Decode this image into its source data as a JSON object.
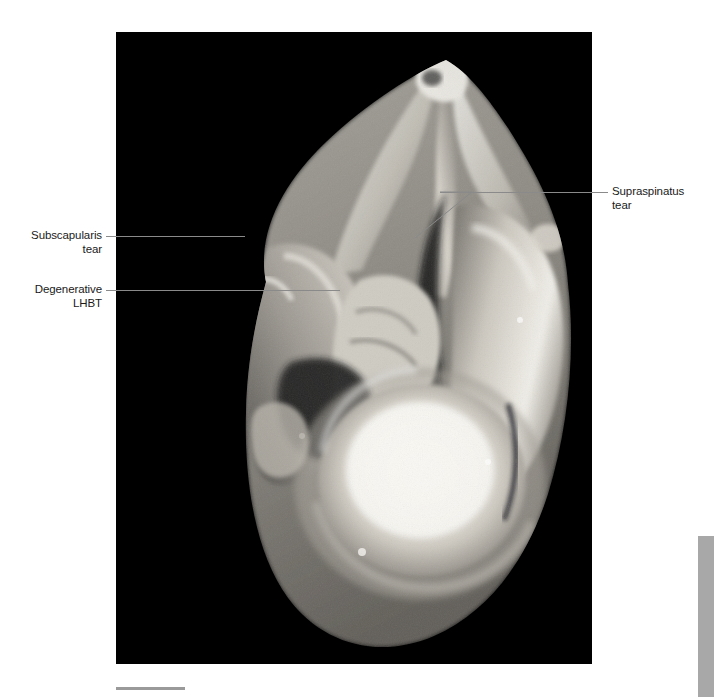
{
  "figure": {
    "kind": "gross-anatomy-photograph",
    "background_color": "#000000",
    "photo_rect": {
      "x": 116,
      "y": 32,
      "width": 476,
      "height": 632
    }
  },
  "annotations": [
    {
      "id": "subscapularis",
      "text": "Subscapularis\ntear",
      "align": "right",
      "leader": {
        "from_x": 106,
        "to_x": 245,
        "y": 236
      }
    },
    {
      "id": "degenerative-lhbt",
      "text": "Degenerative\nLHBT",
      "align": "right",
      "leader": {
        "from_x": 106,
        "to_x": 340,
        "y": 290
      }
    },
    {
      "id": "supraspinatus",
      "text": "Supraspinatus\ntear",
      "align": "left",
      "leader": {
        "from_x": 440,
        "to_x": 608,
        "y": 192
      }
    }
  ],
  "marks": {
    "bottom_rule_color": "#9a9a9a",
    "edge_tab_color": "#a8a8a8"
  }
}
